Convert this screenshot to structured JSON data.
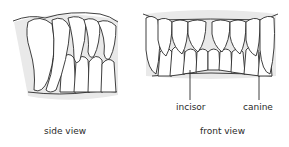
{
  "figure": {
    "panels": [
      {
        "id": "side",
        "caption": "side view"
      },
      {
        "id": "front",
        "caption": "front view",
        "callouts": [
          {
            "label": "incisor"
          },
          {
            "label": "canine"
          }
        ]
      }
    ],
    "colors": {
      "line": "#2b2b2b",
      "background": "#ffffff",
      "shade": "#e9e9e9"
    }
  }
}
